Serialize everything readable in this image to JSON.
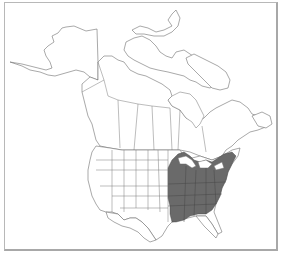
{
  "map": {
    "type": "species-range-map",
    "region": "North America",
    "regions_shown": [
      "Alaska",
      "Canada",
      "Contiguous United States",
      "Northern Mexico"
    ],
    "legend": [],
    "colors": {
      "background": "#ffffff",
      "outline": "#6e6e6e",
      "range_fill": "#6a6a6a",
      "frame": "#b8b8b8"
    },
    "range": {
      "description": "Shaded distribution covering the eastern United States",
      "extent": "Eastern US from southern Great Lakes and New England south to the Gulf Coast, west to eastern Texas/Oklahoma/Kansas"
    }
  }
}
